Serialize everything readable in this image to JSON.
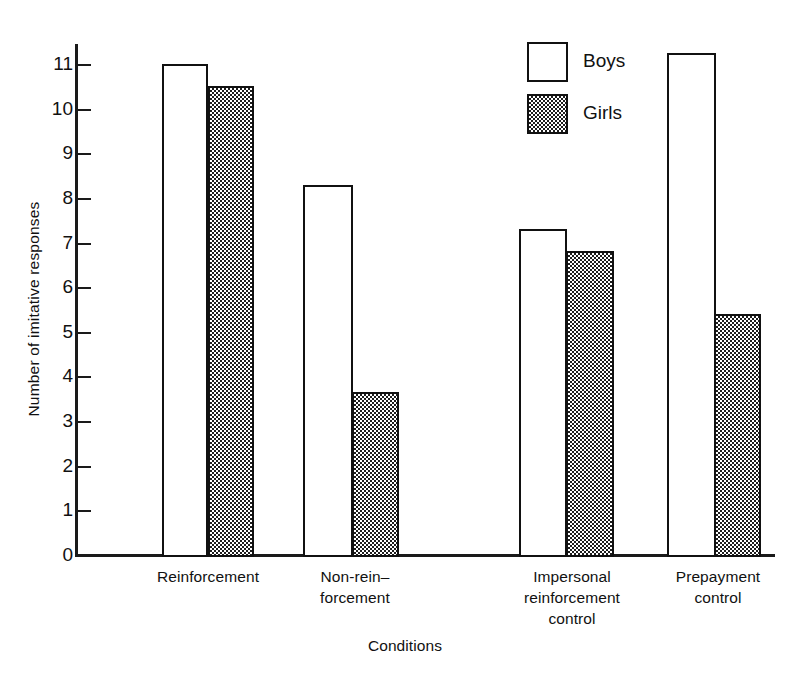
{
  "chart_data": {
    "type": "bar",
    "title": "",
    "xlabel": "Conditions",
    "ylabel": "Number of imitative responses",
    "ylim": [
      0,
      11.6
    ],
    "yticks": [
      0,
      1,
      2,
      3,
      4,
      5,
      6,
      7,
      8,
      9,
      10,
      11
    ],
    "ytick_labels": [
      "0",
      "1",
      "2",
      "3",
      "4",
      "5",
      "6",
      "7",
      "8",
      "9",
      "10",
      "11"
    ],
    "grid": false,
    "legend_position": "upper center",
    "categories": [
      "Reinforcement",
      "Non-rein–\nforcement",
      "Impersonal\nreinforcement\ncontrol",
      "Prepayment\ncontrol"
    ],
    "category_lines": [
      [
        "Reinforcement"
      ],
      [
        "Non-rein–",
        "forcement"
      ],
      [
        "Impersonal",
        "reinforcement",
        "control"
      ],
      [
        "Prepayment",
        "control"
      ]
    ],
    "series": [
      {
        "name": "Boys",
        "fill": "white",
        "color": "#ffffff",
        "edge_color": "#111111",
        "values": [
          11.0,
          8.3,
          7.3,
          11.25
        ]
      },
      {
        "name": "Girls",
        "fill": "checkerboard-halftone",
        "color": "#9a9a9a",
        "edge_color": "#111111",
        "values": [
          10.5,
          3.65,
          6.8,
          5.4
        ]
      }
    ]
  },
  "legend": {
    "items": [
      {
        "label": "Boys",
        "swatch": "open-square-swatch"
      },
      {
        "label": "Girls",
        "swatch": "hatched-square-swatch"
      }
    ]
  },
  "axes": {
    "y_title": "Number of imitative responses",
    "x_title": "Conditions"
  }
}
